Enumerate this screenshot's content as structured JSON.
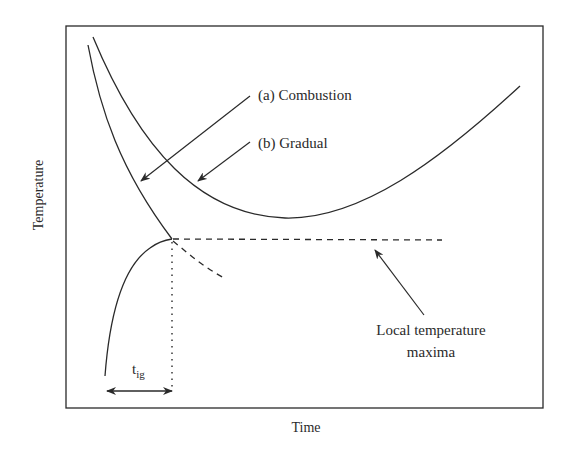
{
  "diagram": {
    "type": "line-schematic",
    "axes": {
      "xlabel": "Time",
      "ylabel": "Temperature",
      "ticks": "none"
    },
    "curves": [
      {
        "id": "a",
        "label": "(a) Combustion",
        "style": "solid",
        "description": "Decreasing then joins ignition point"
      },
      {
        "id": "b",
        "label": "(b) Gradual",
        "style": "solid",
        "description": "U-shaped: decreases to a minimum then increases"
      },
      {
        "id": "ignition-rise",
        "label": "",
        "style": "solid",
        "description": "Rising curve up to ignition point"
      },
      {
        "id": "local-max-line",
        "label": "",
        "style": "dashed",
        "description": "Horizontal line of local temperature maxima"
      },
      {
        "id": "decay-branch",
        "label": "",
        "style": "dashed",
        "description": "Decaying branch after ignition point"
      }
    ],
    "annotations": {
      "combustion": "(a) Combustion",
      "gradual": "(b) Gradual",
      "local_max_line1": "Local temperature",
      "local_max_line2": "maxima",
      "tig_main": "t",
      "tig_sub": "ig"
    },
    "colors": {
      "line": "#2a2a2a",
      "background": "#ffffff"
    }
  }
}
